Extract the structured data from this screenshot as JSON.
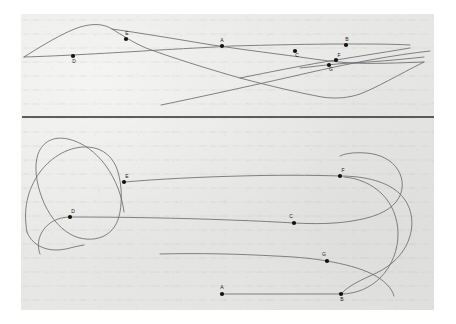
{
  "figure": {
    "background_color": "#e7e7e5",
    "page_color": "#ffffff",
    "curve_color": "#6d6d70",
    "dot_color": "#121214",
    "divider_color": "#2e2e30",
    "panel": {
      "x": 21,
      "y": 14,
      "width": 413,
      "height": 296
    },
    "divider": {
      "y": 117,
      "x1": 22,
      "x2": 434
    },
    "watermark": "",
    "panels": [
      {
        "name": "top-panel",
        "id": "panel-top",
        "points": [
          {
            "label": "E",
            "x": 126,
            "y": 39,
            "label_x": 127,
            "label_y": 35
          },
          {
            "label": "A",
            "x": 222,
            "y": 46,
            "label_x": 222,
            "label_y": 42
          },
          {
            "label": "C",
            "x": 295,
            "y": 51,
            "label_x": 297,
            "label_y": 57
          },
          {
            "label": "B",
            "x": 346,
            "y": 45,
            "label_x": 347,
            "label_y": 41
          },
          {
            "label": "F",
            "x": 336,
            "y": 60,
            "label_x": 339,
            "label_y": 57
          },
          {
            "label": "G",
            "x": 329,
            "y": 65,
            "label_x": 331,
            "label_y": 71
          },
          {
            "label": "D",
            "x": 73,
            "y": 56,
            "label_x": 74,
            "label_y": 63
          }
        ]
      },
      {
        "name": "bottom-panel",
        "id": "panel-bottom",
        "points": [
          {
            "label": "E",
            "x": 124,
            "y": 182,
            "label_x": 127,
            "label_y": 178
          },
          {
            "label": "F",
            "x": 340,
            "y": 176,
            "label_x": 343,
            "label_y": 172
          },
          {
            "label": "D",
            "x": 70,
            "y": 217,
            "label_x": 73,
            "label_y": 213
          },
          {
            "label": "C",
            "x": 294,
            "y": 223,
            "label_x": 291,
            "label_y": 218
          },
          {
            "label": "G",
            "x": 327,
            "y": 261,
            "label_x": 324,
            "label_y": 256
          },
          {
            "label": "A",
            "x": 222,
            "y": 294,
            "label_x": 222,
            "label_y": 289
          },
          {
            "label": "B",
            "x": 341,
            "y": 294,
            "label_x": 342,
            "label_y": 301
          }
        ]
      }
    ],
    "paths": {
      "top": [
        "M 24 57 C 40 47 62 33 80 27 C 94 23 104 24 112 29 C 122 35 132 42 146 48 C 170 57 205 68 240 78 C 270 86 300 93 322 97 C 336 99 348 98 360 94 C 376 88 398 75 424 62",
        "M 24 57 C 60 56 110 53 160 50 C 195 48 215 47 232 46 C 270 45 310 44 346 44 C 372 44 392 44 410 45",
        "M 112 29 C 140 33 170 38 200 43 C 230 48 270 53 300 57 C 320 60 336 62 352 63 C 372 64 396 63 424 62",
        "M 161 105 C 200 97 250 86 290 77 C 320 70 348 64 370 60 C 392 56 412 53 430 51",
        "M 300 68 C 318 66 334 64 350 63 C 372 62 396 60 424 57",
        "M 240 78 C 270 72 300 66 324 62 C 348 58 380 53 410 48"
      ],
      "bottom": [
        "M 27 232 C 23 210 27 190 40 172 C 52 156 70 146 88 147 C 104 148 114 158 118 172 C 122 186 122 200 120 212 C 118 224 112 232 104 236 C 94 241 80 240 70 234 C 58 227 48 214 42 198 C 36 182 34 166 38 154 C 43 141 54 136 68 139 C 82 142 96 152 106 166 C 116 180 122 196 124 212",
        "M 27 232 C 31 243 42 250 56 250 C 62 250 66 249 70 248 C 74 247 78 246 84 245",
        "M 70 217 C 120 217 180 218 230 220 C 258 221 278 222 294 223 C 314 224 334 224 352 221 C 372 218 388 212 396 202 C 404 192 404 180 398 170 C 392 160 380 154 366 153 C 352 152 344 154 340 156",
        "M 124 182 C 160 179 200 177 240 176 C 275 175 310 175 340 176",
        "M 340 176 C 366 176 388 182 400 194 C 412 206 414 222 410 236 C 406 250 396 262 382 270 C 368 278 352 282 341 294",
        "M 70 217 C 60 217 50 221 44 229 C 38 237 37 246 40 254",
        "M 160 254 C 200 253 240 254 275 256 C 300 257 316 259 327 261 C 344 264 360 268 372 274 C 384 280 392 288 394 296",
        "M 222 294 L 341 294",
        "M 341 294 C 356 294 370 288 380 278 C 392 266 398 250 398 234 C 398 218 392 204 382 194 C 372 184 358 178 344 177"
      ]
    }
  }
}
